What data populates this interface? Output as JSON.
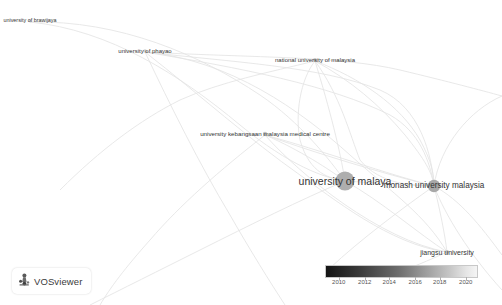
{
  "app": {
    "name": "VOSviewer",
    "badge_label": "VOSviewer",
    "logo_icon": "vosviewer-logo-icon",
    "background_color": "#ffffff"
  },
  "chart_data": {
    "type": "scatter",
    "title": "",
    "subtitle": "",
    "xlabel": "",
    "ylabel": "",
    "grid": false,
    "nodes": [
      {
        "label": "university of brawijaya",
        "x": 30,
        "y": 21,
        "r": 1.4,
        "color": "#d8d8d8",
        "font_size": 5.4
      },
      {
        "label": "university of phayao",
        "x": 145,
        "y": 51,
        "r": 1.8,
        "color": "#cfcfcf",
        "font_size": 6.0
      },
      {
        "label": "national university of malaysia",
        "x": 315,
        "y": 60,
        "r": 2.0,
        "color": "#c9c9c9",
        "font_size": 6.0
      },
      {
        "label": "university kebangsaan malaysia medical centre",
        "x": 265,
        "y": 134,
        "r": 2.2,
        "color": "#c4c4c4",
        "font_size": 6.2
      },
      {
        "label": "university of malaya",
        "x": 345,
        "y": 181,
        "r": 9.5,
        "color": "#aeaeae",
        "font_size": 10.5
      },
      {
        "label": "monash university malaysia",
        "x": 434,
        "y": 186,
        "r": 6.2,
        "color": "#a8a8a8",
        "font_size": 8.2
      },
      {
        "label": "jiangsu university",
        "x": 447,
        "y": 252,
        "r": 2.0,
        "color": "#c0c0c0",
        "font_size": 7.0
      }
    ],
    "edge_color": "#e4e4e4",
    "legend": {
      "position": "bottom-right",
      "type": "continuous-color-scale",
      "scale_min": 2009,
      "scale_max": 2021,
      "ticks": [
        {
          "value": "2010",
          "pos_pct": 9
        },
        {
          "value": "2012",
          "pos_pct": 26
        },
        {
          "value": "2014",
          "pos_pct": 42
        },
        {
          "value": "2016",
          "pos_pct": 59
        },
        {
          "value": "2018",
          "pos_pct": 75
        },
        {
          "value": "2020",
          "pos_pct": 92
        }
      ],
      "gradient_from": "#141414",
      "gradient_to": "#f5f5f5"
    }
  }
}
